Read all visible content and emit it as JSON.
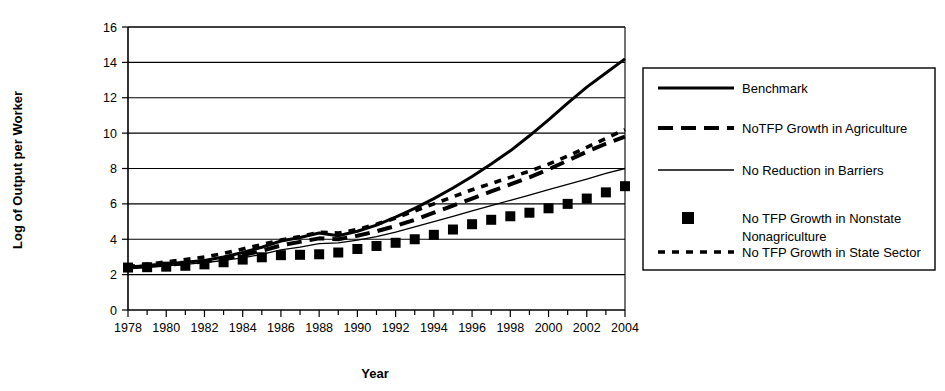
{
  "chart_data": {
    "type": "line",
    "title": "",
    "xlabel": "Year",
    "ylabel": "Log of Output per Worker",
    "xlim": [
      1978,
      2004
    ],
    "ylim": [
      0,
      16
    ],
    "yticks": [
      0,
      2,
      4,
      6,
      8,
      10,
      12,
      14,
      16
    ],
    "ytick_labels": [
      "0",
      "2",
      "4",
      "6",
      "8",
      "10",
      "12",
      "14",
      "16"
    ],
    "xticks": [
      1978,
      1980,
      1982,
      1984,
      1986,
      1988,
      1990,
      1992,
      1994,
      1996,
      1998,
      2000,
      2002,
      2004
    ],
    "xtick_labels": [
      "1978",
      "1980",
      "1982",
      "1984",
      "1986",
      "1988",
      "1990",
      "1992",
      "1994",
      "1996",
      "1998",
      "2000",
      "2002",
      "2004"
    ],
    "x_minor_ticks": [
      1979,
      1981,
      1983,
      1985,
      1987,
      1989,
      1991,
      1993,
      1995,
      1997,
      1999,
      2001,
      2003
    ],
    "grid": "horizontal",
    "legend_position": "right-outside",
    "x": [
      1978,
      1979,
      1980,
      1981,
      1982,
      1983,
      1984,
      1985,
      1986,
      1987,
      1988,
      1989,
      1990,
      1991,
      1992,
      1993,
      1994,
      1995,
      1996,
      1997,
      1998,
      1999,
      2000,
      2001,
      2002,
      2003,
      2004
    ],
    "series": [
      {
        "name": "Benchmark",
        "style": "solid-thick",
        "color": "#000000",
        "values": [
          2.4,
          2.5,
          2.6,
          2.7,
          2.8,
          3.0,
          3.25,
          3.55,
          3.9,
          4.1,
          4.35,
          4.2,
          4.45,
          4.8,
          5.25,
          5.75,
          6.3,
          6.9,
          7.55,
          8.25,
          9.0,
          9.85,
          10.75,
          11.7,
          12.6,
          13.4,
          14.2
        ]
      },
      {
        "name": "NoTFP Growth in Agriculture",
        "style": "dashed-thick",
        "color": "#000000",
        "values": [
          2.4,
          2.48,
          2.56,
          2.64,
          2.74,
          2.9,
          3.1,
          3.35,
          3.65,
          3.85,
          4.05,
          4.0,
          4.2,
          4.45,
          4.75,
          5.1,
          5.5,
          5.9,
          6.3,
          6.7,
          7.1,
          7.5,
          7.95,
          8.45,
          8.95,
          9.4,
          9.8
        ]
      },
      {
        "name": "No Reduction in Barriers",
        "style": "solid-thin",
        "color": "#000000",
        "values": [
          2.35,
          2.42,
          2.5,
          2.58,
          2.68,
          2.8,
          2.95,
          3.15,
          3.4,
          3.55,
          3.75,
          3.8,
          3.95,
          4.15,
          4.4,
          4.7,
          5.0,
          5.3,
          5.6,
          5.9,
          6.2,
          6.5,
          6.8,
          7.1,
          7.4,
          7.72,
          8.0
        ]
      },
      {
        "name": "No TFP Growth in Nonstate Nonagriculture",
        "style": "markers-square",
        "color": "#000000",
        "values": [
          2.4,
          2.42,
          2.45,
          2.5,
          2.58,
          2.7,
          2.85,
          2.98,
          3.1,
          3.12,
          3.15,
          3.25,
          3.45,
          3.62,
          3.8,
          4.0,
          4.25,
          4.55,
          4.85,
          5.1,
          5.3,
          5.5,
          5.75,
          6.0,
          6.3,
          6.65,
          7.0
        ]
      },
      {
        "name": "No TFP Growth in State Sector",
        "style": "dotted-thick",
        "color": "#000000",
        "values": [
          2.45,
          2.58,
          2.72,
          2.85,
          3.0,
          3.2,
          3.45,
          3.7,
          3.95,
          4.15,
          4.4,
          4.35,
          4.55,
          4.85,
          5.2,
          5.6,
          6.0,
          6.4,
          6.8,
          7.15,
          7.5,
          7.85,
          8.25,
          8.7,
          9.2,
          9.7,
          10.2
        ]
      }
    ]
  },
  "legend": {
    "items": [
      {
        "label": "Benchmark",
        "sample": "solid-thick"
      },
      {
        "label": "NoTFP Growth in Agriculture",
        "sample": "dashed-thick"
      },
      {
        "label": "No Reduction in Barriers",
        "sample": "solid-thin"
      },
      {
        "label": "No TFP Growth in Nonstate",
        "label2": "Nonagriculture",
        "sample": "markers-square"
      },
      {
        "label": "No TFP Growth in State Sector",
        "sample": "dotted-thick"
      }
    ]
  }
}
